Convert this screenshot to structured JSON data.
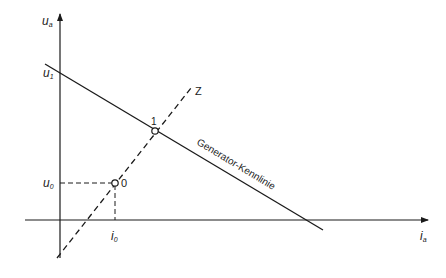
{
  "diagram": {
    "axes": {
      "y_label": "u",
      "y_label_sub": "a",
      "x_label": "i",
      "x_label_sub": "a"
    },
    "labels": {
      "u1": "u",
      "u1_sub": "1",
      "u0": "u",
      "u0_sub": "0",
      "i0": "i",
      "i0_sub": "0",
      "point0": "0",
      "point1": "1",
      "z_line": "Z",
      "generator_curve": "Generator-Kennlinie"
    },
    "colors": {
      "line": "#1a1a1a",
      "background": "#ffffff"
    }
  }
}
